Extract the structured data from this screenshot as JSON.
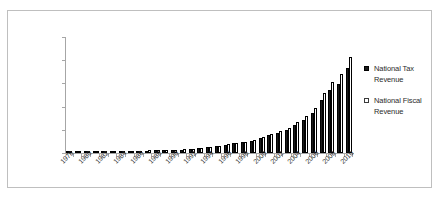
{
  "chart_data": {
    "type": "bar",
    "title": "",
    "xlabel": "",
    "ylabel": "",
    "ylim": [
      0,
      100000
    ],
    "y_ticks": [
      "0",
      "20,000",
      "40,000",
      "60,000",
      "80,000",
      "100,000"
    ],
    "y_tick_values": [
      0,
      20000,
      40000,
      60000,
      80000,
      100000
    ],
    "grid": false,
    "legend_position": "right",
    "categories": [
      "1978",
      "1979",
      "1980",
      "1981",
      "1982",
      "1983",
      "1984",
      "1985",
      "1986",
      "1987",
      "1988",
      "1989",
      "1990",
      "1991",
      "1992",
      "1993",
      "1994",
      "1995",
      "1996",
      "1997",
      "1998",
      "1999",
      "2000",
      "2001",
      "2002",
      "2003",
      "2004",
      "2005",
      "2006",
      "2007",
      "2008",
      "2009",
      "2010"
    ],
    "x_tick_labels": [
      "1978",
      "1980",
      "1982",
      "1984",
      "1986",
      "1988",
      "1990",
      "1992",
      "1994",
      "1996",
      "1998",
      "2000",
      "2002",
      "2004",
      "2006",
      "2008",
      "2010"
    ],
    "series": [
      {
        "name": "National Tax Revenue",
        "color": "#1a1a1a",
        "marker": "filled-square",
        "values": [
          519,
          537,
          572,
          630,
          700,
          775,
          947,
          2041,
          2091,
          2140,
          2390,
          2727,
          2822,
          2990,
          3297,
          4255,
          5127,
          6038,
          6910,
          8234,
          9263,
          10683,
          12582,
          15301,
          17004,
          20017,
          24166,
          28779,
          34804,
          45622,
          54224,
          59522,
          73211
        ]
      },
      {
        "name": "National Fiscal Revenue",
        "color": "#ffffff",
        "marker": "hollow-square",
        "values": [
          1132,
          1146,
          1160,
          1176,
          1212,
          1367,
          1643,
          2005,
          2122,
          2199,
          2357,
          2665,
          2937,
          3149,
          3483,
          4349,
          5218,
          6242,
          7408,
          8651,
          9876,
          11444,
          13395,
          16386,
          18904,
          21715,
          26396,
          31649,
          38760,
          51322,
          61330,
          68518,
          83102
        ]
      }
    ]
  },
  "legend": {
    "entries": [
      {
        "label": "National Tax Revenue",
        "swatch": "filled-square"
      },
      {
        "label": "National Fiscal Revenue",
        "swatch": "hollow-square"
      }
    ]
  }
}
